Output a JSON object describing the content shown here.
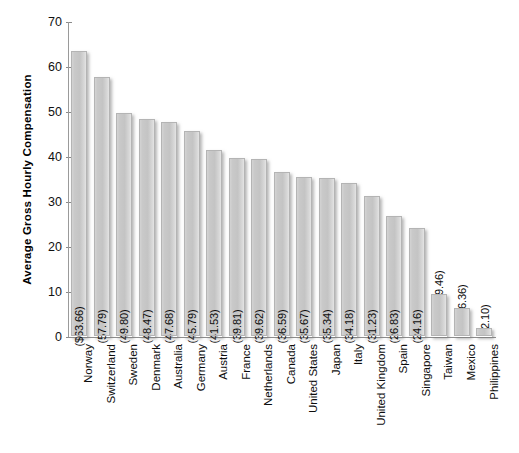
{
  "chart_data": {
    "type": "bar",
    "title": "",
    "subtitle": "",
    "xlabel": "",
    "ylabel": "Average Gross Hourly Compensation",
    "ylim": [
      0,
      70
    ],
    "ytick_step": 10,
    "yticks": [
      "70",
      "60",
      "50",
      "40",
      "30",
      "20",
      "10",
      "0"
    ],
    "grid": false,
    "legend": null,
    "orientation": "vertical",
    "bar_color": "#c9c9c9",
    "bar_edge_color": "#b4b4b4",
    "categories": [
      "Norway",
      "Switzerland",
      "Sweden",
      "Denmark",
      "Australia",
      "Germany",
      "Austria",
      "France",
      "Netherlands",
      "Canada",
      "United States",
      "Japan",
      "Italy",
      "United Kingdom",
      "Spain",
      "Singapore",
      "Taiwan",
      "Mexico",
      "Philippines"
    ],
    "values": [
      63.66,
      57.79,
      49.8,
      48.47,
      47.68,
      45.79,
      41.53,
      39.81,
      39.62,
      36.59,
      35.67,
      35.34,
      34.18,
      31.23,
      26.83,
      24.16,
      9.46,
      6.36,
      2.1
    ],
    "data_labels": [
      "($63.66)",
      "(57.79)",
      "(49.80)",
      "(48.47)",
      "(47.68)",
      "(45.79)",
      "(41.53)",
      "(39.81)",
      "(39.62)",
      "(36.59)",
      "(35.67)",
      "(35.34)",
      "(34.18)",
      "(31.23)",
      "(26.83)",
      "(24.16)",
      "(9.46)",
      "(6.36)",
      "(2.10)"
    ]
  }
}
